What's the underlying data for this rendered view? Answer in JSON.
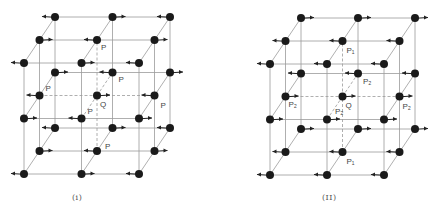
{
  "figure": {
    "panels": [
      {
        "id": "i",
        "caption": "(i)",
        "origin": [
          24,
          174
        ],
        "a": [
          57.5,
          0
        ],
        "b": [
          0,
          -55.5
        ],
        "c": [
          15.5,
          -23
        ],
        "central_atom_label": "Q",
        "neighbor_labels": [
          {
            "text": "P",
            "ijk": [
              1,
              2,
              1
            ],
            "dx": 4,
            "dy": 10
          },
          {
            "text": "P",
            "ijk": [
              1,
              1,
              2
            ],
            "dx": 6,
            "dy": 9
          },
          {
            "text": "P",
            "ijk": [
              0,
              1,
              1
            ],
            "dx": 6,
            "dy": -5
          },
          {
            "text": "P",
            "ijk": [
              2,
              1,
              1
            ],
            "dx": 6,
            "dy": 12
          },
          {
            "text": "P",
            "ijk": [
              1,
              1,
              0
            ],
            "dx": 6,
            "dy": -5
          },
          {
            "text": "P",
            "ijk": [
              1,
              0,
              1
            ],
            "dx": 8,
            "dy": -2
          }
        ]
      },
      {
        "id": "ii",
        "caption": "(II)",
        "origin": [
          270,
          175
        ],
        "a": [
          57,
          0
        ],
        "b": [
          0,
          -55.5
        ],
        "c": [
          15.5,
          -23
        ],
        "central_atom_label": "Q",
        "neighbor_labels": [
          {
            "text": "P₁",
            "ijk": [
              1,
              2,
              1
            ],
            "dx": 4,
            "dy": 12
          },
          {
            "text": "P₂",
            "ijk": [
              1,
              1,
              2
            ],
            "dx": 5,
            "dy": 10
          },
          {
            "text": "P₂",
            "ijk": [
              0,
              1,
              1
            ],
            "dx": 3,
            "dy": 10
          },
          {
            "text": "P₂",
            "ijk": [
              2,
              1,
              1
            ],
            "dx": 3,
            "dy": 12
          },
          {
            "text": "P₂",
            "ijk": [
              1,
              1,
              0
            ],
            "dx": 8,
            "dy": -6
          },
          {
            "text": "P₁",
            "ijk": [
              1,
              0,
              1
            ],
            "dx": 4,
            "dy": 12
          }
        ]
      }
    ],
    "spins": {
      "note": "spin direction per atom indexed [k][j][i]; k=depth (0 front), j=row (0 bottom), i=column (0 left); -1 left, +1 right",
      "i": [
        [
          [
            -1,
            1,
            -1
          ],
          [
            1,
            -1,
            1
          ],
          [
            -1,
            1,
            -1
          ]
        ],
        [
          [
            1,
            -1,
            1
          ],
          [
            -1,
            1,
            -1
          ],
          [
            1,
            -1,
            1
          ]
        ],
        [
          [
            -1,
            1,
            -1
          ],
          [
            1,
            -1,
            1
          ],
          [
            -1,
            1,
            -1
          ]
        ]
      ],
      "ii": [
        [
          [
            -1,
            -1,
            -1
          ],
          [
            1,
            1,
            1
          ],
          [
            -1,
            -1,
            -1
          ]
        ],
        [
          [
            -1,
            -1,
            -1
          ],
          [
            1,
            1,
            1
          ],
          [
            -1,
            -1,
            -1
          ]
        ],
        [
          [
            1,
            1,
            1
          ],
          [
            -1,
            -1,
            -1
          ],
          [
            1,
            1,
            1
          ]
        ]
      ]
    },
    "colors": {
      "line": "#9a9a9a",
      "atom": "#1a1a1a",
      "arrow": "#222222",
      "label": "#444444"
    }
  }
}
